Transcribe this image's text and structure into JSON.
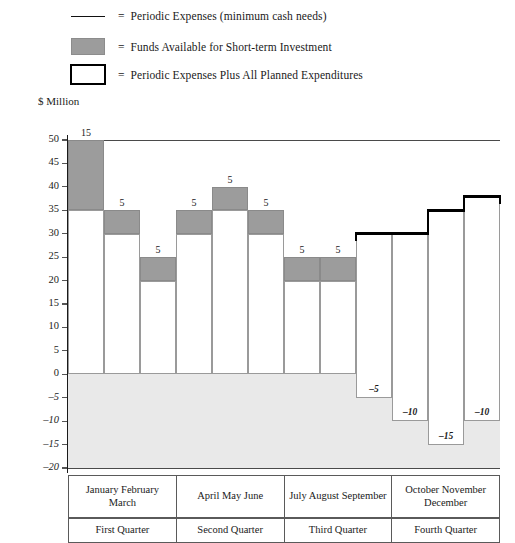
{
  "legend": {
    "items": [
      {
        "icon": "line-swatch",
        "equals": "=",
        "label": "Periodic Expenses (minimum cash needs)"
      },
      {
        "icon": "filled-box-swatch",
        "equals": "=",
        "label": "Funds Available for Short-term Investment"
      },
      {
        "icon": "outlined-box-swatch",
        "equals": "=",
        "label": "Periodic Expenses Plus All Planned Expenditures"
      }
    ]
  },
  "axis_title": "$ Million",
  "months_row": [
    "January February March",
    "April May June",
    "July August September",
    "October November December"
  ],
  "quarters_row": [
    "First Quarter",
    "Second Quarter",
    "Third Quarter",
    "Fourth Quarter"
  ],
  "colors": {
    "invest_fill": "#9c9c9c",
    "negative_band": "#e9e9e9",
    "plan_line": "#000000",
    "bar_outline": "#9a9a9a",
    "grid": "#7a7a7a"
  },
  "chart_data": {
    "type": "bar",
    "title": "",
    "xlabel": "",
    "ylabel": "$ Million",
    "ylim": [
      -20,
      50
    ],
    "yticks": [
      -20,
      -15,
      -10,
      -5,
      0,
      5,
      10,
      15,
      20,
      25,
      30,
      35,
      40,
      45,
      50
    ],
    "ytick_labels": [
      "-20",
      "-15",
      "-10",
      "-5",
      "0",
      "5",
      "10",
      "15",
      "20",
      "25",
      "30",
      "35",
      "40",
      "45",
      "50"
    ],
    "grid": true,
    "legend_position": "top",
    "categories": [
      "January",
      "February",
      "March",
      "April",
      "May",
      "June",
      "July",
      "August",
      "September",
      "October",
      "November",
      "December"
    ],
    "series": [
      {
        "name": "Periodic Expenses (minimum cash needs)",
        "note": "bottom of each bar box",
        "values": [
          0,
          0,
          0,
          0,
          0,
          0,
          0,
          0,
          -5,
          -10,
          -15,
          -10
        ]
      },
      {
        "name": "Periodic Expenses Plus All Planned Expenditures",
        "note": "top of bar box / bold outline where drawn",
        "values": [
          35,
          30,
          20,
          30,
          35,
          30,
          20,
          20,
          30,
          30,
          35,
          38
        ]
      },
      {
        "name": "Funds Available for Short-term Investment",
        "note": "shaded band above bar top",
        "values": [
          15,
          5,
          5,
          5,
          5,
          5,
          5,
          5,
          0,
          0,
          0,
          0
        ]
      }
    ],
    "bar_tops": [
      50,
      35,
      25,
      35,
      40,
      35,
      25,
      25,
      30,
      30,
      35,
      38
    ],
    "bar_bottoms": [
      0,
      0,
      0,
      0,
      0,
      0,
      0,
      0,
      -5,
      -10,
      -15,
      -10
    ],
    "invest_labels": [
      "15",
      "5",
      "5",
      "5",
      "5",
      "5",
      "5",
      "5",
      "",
      "",
      "",
      ""
    ],
    "negative_labels": [
      "",
      "",
      "",
      "",
      "",
      "",
      "",
      "",
      "-5",
      "-10",
      "-15",
      "-10"
    ],
    "bold_outline_months": [
      "September",
      "October",
      "November",
      "December"
    ]
  }
}
